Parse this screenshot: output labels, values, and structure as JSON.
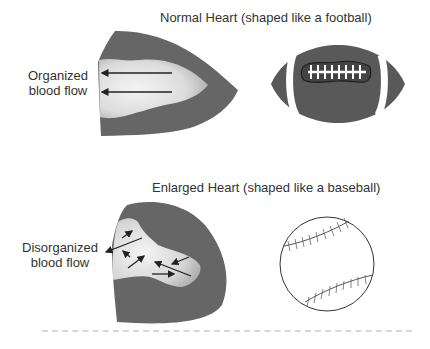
{
  "panels": {
    "normal": {
      "title": "Normal Heart (shaped like a football)",
      "flow_label_line1": "Organized",
      "flow_label_line2": "blood flow",
      "comparison_object": "football-icon"
    },
    "enlarged": {
      "title": "Enlarged Heart (shaped like a baseball)",
      "flow_label_line1": "Disorganized",
      "flow_label_line2": "blood flow",
      "comparison_object": "baseball-icon"
    }
  },
  "colors": {
    "heart_wall": "#666666",
    "cavity_light": "#f2f2f2",
    "cavity_dark": "#a8a8a8",
    "football": "#595959",
    "text": "#333333"
  }
}
